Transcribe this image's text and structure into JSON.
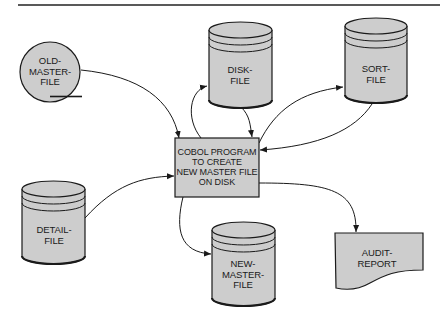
{
  "diagram": {
    "type": "system-flowchart",
    "colors": {
      "fill": "#cdcdcd",
      "stroke": "#1a1a1a",
      "background": "#ffffff"
    },
    "nodes": [
      {
        "id": "old_master",
        "shape": "magnetic-tape",
        "label": "OLD-\nMASTER-\nFILE"
      },
      {
        "id": "disk_file",
        "shape": "disk-cylinder",
        "label": "DISK-\nFILE"
      },
      {
        "id": "sort_file",
        "shape": "disk-cylinder",
        "label": "SORT-\nFILE"
      },
      {
        "id": "cobol_program",
        "shape": "process-box",
        "label": "COBOL PROGRAM\nTO CREATE\nNEW MASTER FILE\nON DISK"
      },
      {
        "id": "detail_file",
        "shape": "disk-cylinder",
        "label": "DETAIL-\nFILE"
      },
      {
        "id": "new_master",
        "shape": "disk-cylinder",
        "label": "NEW-\nMASTER-\nFILE"
      },
      {
        "id": "audit_report",
        "shape": "document",
        "label": "AUDIT-\nREPORT"
      }
    ],
    "edges": [
      {
        "from": "old_master",
        "to": "cobol_program"
      },
      {
        "from": "disk_file",
        "to": "cobol_program"
      },
      {
        "from": "cobol_program",
        "to": "disk_file"
      },
      {
        "from": "cobol_program",
        "to": "sort_file"
      },
      {
        "from": "sort_file",
        "to": "cobol_program"
      },
      {
        "from": "detail_file",
        "to": "cobol_program"
      },
      {
        "from": "cobol_program",
        "to": "new_master"
      },
      {
        "from": "cobol_program",
        "to": "audit_report"
      }
    ]
  }
}
